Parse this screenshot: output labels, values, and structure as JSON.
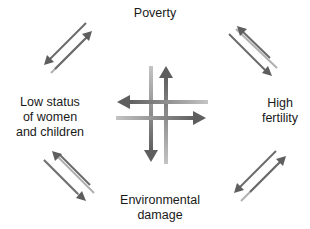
{
  "diagram": {
    "nodes": {
      "top": "Poverty",
      "left_line1": "Low status",
      "left_line2": "of women",
      "left_line3": "and children",
      "right_line1": "High",
      "right_line2": "fertility",
      "bottom_line1": "Environmental",
      "bottom_line2": "damage"
    },
    "relationships": [
      {
        "from": "Poverty",
        "to": "Low status of women and children",
        "bidirectional": true
      },
      {
        "from": "Poverty",
        "to": "High fertility",
        "bidirectional": true
      },
      {
        "from": "Low status of women and children",
        "to": "Environmental damage",
        "bidirectional": true
      },
      {
        "from": "High fertility",
        "to": "Environmental damage",
        "bidirectional": true
      },
      {
        "from": "Poverty",
        "to": "Environmental damage",
        "bidirectional": true
      },
      {
        "from": "Low status of women and children",
        "to": "High fertility",
        "bidirectional": true
      }
    ],
    "colors": {
      "dark_arrow": "#666666",
      "light_arrow": "#b3b3b3",
      "text": "#1a1a1a"
    }
  }
}
